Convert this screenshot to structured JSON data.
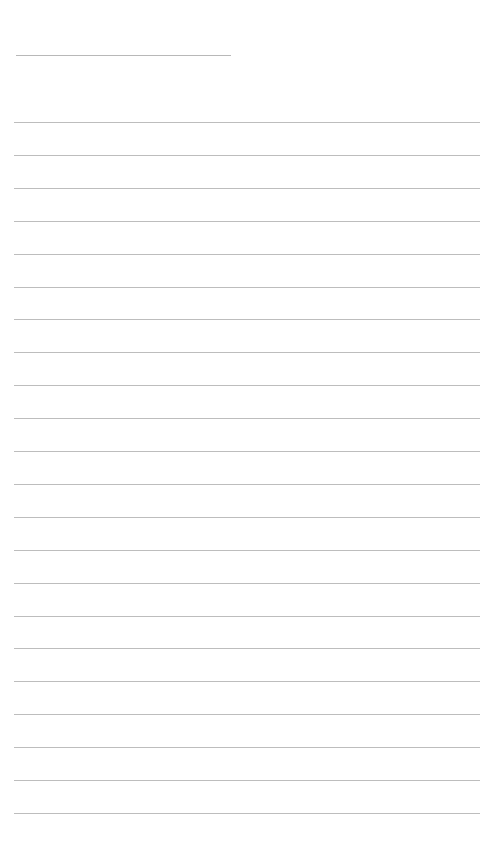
{
  "page": {
    "type": "lined-paper",
    "header_line": {
      "x": 16,
      "y": 55,
      "width": 215
    },
    "ruled_lines": {
      "count": 22,
      "first_y": 122,
      "spacing": 32.9,
      "x": 14,
      "width": 466
    },
    "line_color": "#bdbdbd",
    "text": ""
  }
}
